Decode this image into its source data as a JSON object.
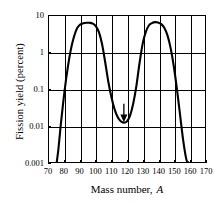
{
  "chart_data": {
    "type": "line",
    "title": "",
    "xlabel": "Mass number, A",
    "ylabel": "Fission yield (percent)",
    "xlim": [
      70,
      170
    ],
    "ylim": [
      0.001,
      10
    ],
    "yscale": "log",
    "grid": true,
    "legend": null,
    "xticks": [
      70,
      80,
      90,
      100,
      110,
      120,
      130,
      140,
      150,
      160,
      170
    ],
    "yticks": [
      0.001,
      0.01,
      0.1,
      1,
      10
    ],
    "ytick_labels": [
      "0.001",
      "0.01",
      "0.1",
      "1",
      "10"
    ],
    "annotations": [
      {
        "type": "arrow",
        "direction": "down",
        "x": 118,
        "y": 0.012,
        "label": ""
      }
    ],
    "series": [
      {
        "name": "Fission yield",
        "x": [
          75,
          76,
          77,
          78,
          80,
          82,
          84,
          86,
          88,
          90,
          92,
          94,
          96,
          98,
          100,
          102,
          104,
          106,
          108,
          110,
          112,
          114,
          116,
          118,
          120,
          122,
          124,
          126,
          128,
          130,
          132,
          134,
          136,
          138,
          140,
          142,
          144,
          146,
          148,
          150,
          152,
          154,
          156,
          158,
          159
        ],
        "y": [
          0.001,
          0.0022,
          0.006,
          0.016,
          0.09,
          0.38,
          1.2,
          2.7,
          4.6,
          5.8,
          6.3,
          6.5,
          6.5,
          6.2,
          5.3,
          3.6,
          1.7,
          0.55,
          0.16,
          0.06,
          0.028,
          0.017,
          0.013,
          0.012,
          0.013,
          0.019,
          0.04,
          0.12,
          0.5,
          1.7,
          3.6,
          5.5,
          6.4,
          6.8,
          6.6,
          6.0,
          4.7,
          2.9,
          1.3,
          0.42,
          0.1,
          0.02,
          0.004,
          0.0012,
          0.001
        ]
      }
    ]
  },
  "axes": {
    "x_title": "Mass number, A",
    "x_title_main": "Mass number,",
    "x_title_italic": "A",
    "y_title": "Fission yield (percent)"
  },
  "colors": {
    "curve": "#000000",
    "grid": "#000000",
    "frame": "#000000",
    "background": "#ffffff"
  }
}
